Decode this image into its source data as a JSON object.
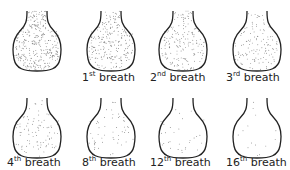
{
  "flasks": [
    {
      "label": "",
      "ord": "",
      "suffix": "",
      "dots": 320
    },
    {
      "label": "1",
      "ord": "st",
      "suffix": " breath",
      "dots": 230
    },
    {
      "label": "2",
      "ord": "nd",
      "suffix": " breath",
      "dots": 170
    },
    {
      "label": "3",
      "ord": "rd",
      "suffix": " breath",
      "dots": 125
    },
    {
      "label": "4",
      "ord": "th",
      "suffix": " breath",
      "dots": 90
    },
    {
      "label": "8",
      "ord": "th",
      "suffix": " breath",
      "dots": 55
    },
    {
      "label": "12",
      "ord": "th",
      "suffix": " breath",
      "dots": 30
    },
    {
      "label": "16",
      "ord": "th",
      "suffix": " breath",
      "dots": 14
    }
  ],
  "colors": {
    "outline": "#222222",
    "dots": "#555555"
  }
}
